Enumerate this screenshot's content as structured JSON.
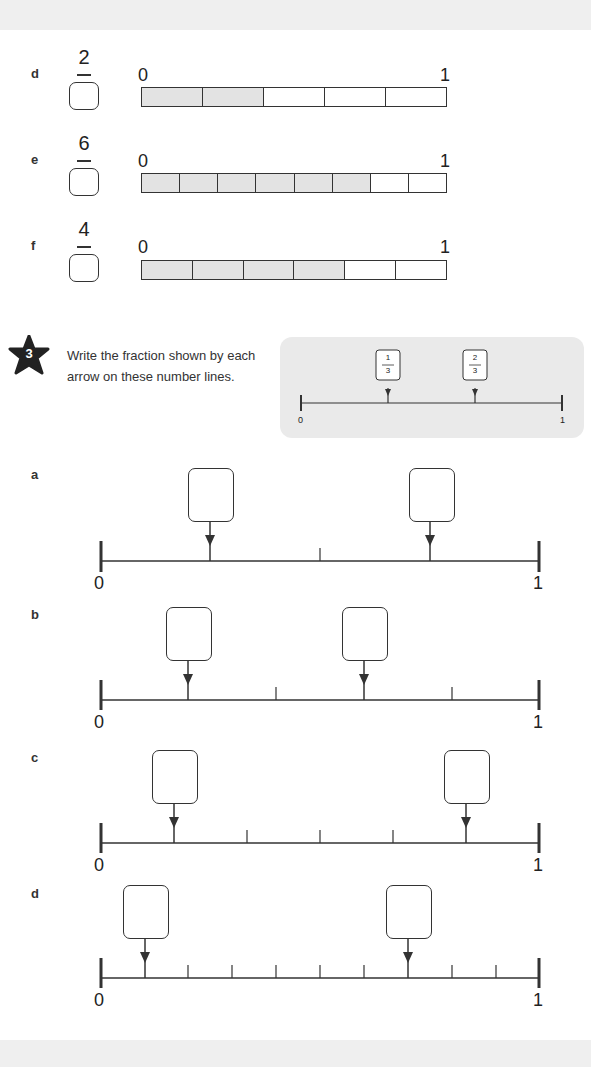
{
  "strip_questions": [
    {
      "label": "d",
      "numerator": "2",
      "denominator_answer": "",
      "parts": 5,
      "shaded": 2,
      "start_label": "0",
      "end_label": "1"
    },
    {
      "label": "e",
      "numerator": "6",
      "denominator_answer": "",
      "parts": 8,
      "shaded": 6,
      "start_label": "0",
      "end_label": "1"
    },
    {
      "label": "f",
      "numerator": "4",
      "denominator_answer": "",
      "parts": 6,
      "shaded": 4,
      "start_label": "0",
      "end_label": "1"
    }
  ],
  "question3": {
    "number": "3",
    "instruction": "Write the fraction shown by each arrow on these number lines.",
    "example": {
      "start_label": "0",
      "end_label": "1",
      "arrows": [
        {
          "numerator": "1",
          "denominator": "3"
        },
        {
          "numerator": "2",
          "denominator": "3"
        }
      ]
    },
    "number_lines": [
      {
        "label": "a",
        "parts": 4,
        "arrow_positions": [
          1,
          3
        ],
        "answers": [
          "",
          ""
        ],
        "start_label": "0",
        "end_label": "1"
      },
      {
        "label": "b",
        "parts": 5,
        "arrow_positions": [
          1,
          3
        ],
        "answers": [
          "",
          ""
        ],
        "start_label": "0",
        "end_label": "1"
      },
      {
        "label": "c",
        "parts": 6,
        "arrow_positions": [
          1,
          5
        ],
        "answers": [
          "",
          ""
        ],
        "start_label": "0",
        "end_label": "1"
      },
      {
        "label": "d",
        "parts": 10,
        "arrow_positions": [
          1,
          7
        ],
        "answers": [
          "",
          ""
        ],
        "start_label": "0",
        "end_label": "1"
      }
    ]
  },
  "colors": {
    "shaded": "#e3e3e3",
    "panel": "#eaeaea",
    "star": "#222222",
    "line": "#333333"
  }
}
